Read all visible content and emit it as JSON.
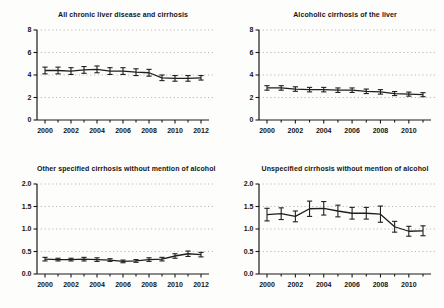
{
  "figure": {
    "background": "#fdfdfb",
    "axis_color": "#1a1a1a",
    "line_color": "#1f1f1f",
    "grid_color": "#a9a9a9",
    "text_color": "#141414"
  },
  "chart_data": [
    {
      "type": "line",
      "title": "All chronic liver disease and cirrhosis",
      "xlabel": "",
      "ylabel": "",
      "x": [
        2000,
        2001,
        2002,
        2003,
        2004,
        2005,
        2006,
        2007,
        2008,
        2009,
        2010,
        2011,
        2012
      ],
      "series": [
        {
          "name": "rate",
          "values": [
            4.4,
            4.4,
            4.35,
            4.45,
            4.5,
            4.35,
            4.35,
            4.25,
            4.2,
            3.75,
            3.7,
            3.7,
            3.75
          ],
          "errors": [
            0.3,
            0.3,
            0.3,
            0.3,
            0.3,
            0.3,
            0.3,
            0.3,
            0.3,
            0.25,
            0.25,
            0.25,
            0.2
          ]
        }
      ],
      "ylim": [
        0,
        8
      ],
      "yticks": [
        0,
        2,
        4,
        6,
        8
      ],
      "ytick_labels": [
        "0",
        "2",
        "4",
        "6",
        "8"
      ],
      "xtick_labels": [
        "2000",
        "2002",
        "2004",
        "2006",
        "2008",
        "2010",
        "2012"
      ],
      "xtick_step": 2,
      "grid": "dotted-horizontal",
      "legend": "none",
      "error_bars": true
    },
    {
      "type": "line",
      "title": "Alcoholic cirrhosis of the liver",
      "xlabel": "",
      "ylabel": "",
      "x": [
        2000,
        2001,
        2002,
        2003,
        2004,
        2005,
        2006,
        2007,
        2008,
        2009,
        2010,
        2011
      ],
      "series": [
        {
          "name": "rate",
          "values": [
            2.85,
            2.85,
            2.75,
            2.7,
            2.7,
            2.65,
            2.65,
            2.55,
            2.5,
            2.35,
            2.3,
            2.25
          ],
          "errors": [
            0.2,
            0.2,
            0.2,
            0.2,
            0.2,
            0.2,
            0.2,
            0.2,
            0.2,
            0.18,
            0.18,
            0.18
          ]
        }
      ],
      "ylim": [
        0,
        8
      ],
      "yticks": [
        0,
        2,
        4,
        6,
        8
      ],
      "ytick_labels": [
        "0",
        "2",
        "4",
        "6",
        "8"
      ],
      "xtick_labels": [
        "2000",
        "2002",
        "2004",
        "2006",
        "2008",
        "2010"
      ],
      "xtick_step": 2,
      "grid": "dotted-horizontal",
      "legend": "none",
      "error_bars": true
    },
    {
      "type": "line",
      "title": "Other specified cirrhosis without mention of alcohol",
      "xlabel": "",
      "ylabel": "",
      "x": [
        2000,
        2001,
        2002,
        2003,
        2004,
        2005,
        2006,
        2007,
        2008,
        2009,
        2010,
        2011,
        2012
      ],
      "series": [
        {
          "name": "rate",
          "values": [
            0.33,
            0.32,
            0.32,
            0.33,
            0.32,
            0.31,
            0.28,
            0.29,
            0.32,
            0.33,
            0.4,
            0.45,
            0.43
          ],
          "errors": [
            0.04,
            0.03,
            0.03,
            0.04,
            0.04,
            0.03,
            0.03,
            0.03,
            0.04,
            0.04,
            0.05,
            0.06,
            0.05
          ]
        }
      ],
      "ylim": [
        0,
        2
      ],
      "yticks": [
        0,
        0.5,
        1,
        1.5,
        2
      ],
      "ytick_labels": [
        "0.0",
        "0.5",
        "1.0",
        "1.5",
        "2.0"
      ],
      "xtick_labels": [
        "2000",
        "2002",
        "2004",
        "2006",
        "2008",
        "2010",
        "2012"
      ],
      "xtick_step": 2,
      "grid": "dotted-horizontal",
      "legend": "none",
      "error_bars": true
    },
    {
      "type": "line",
      "title": "Unspecified cirrhosis without mention of alcohol",
      "xlabel": "",
      "ylabel": "",
      "x": [
        2000,
        2001,
        2002,
        2003,
        2004,
        2005,
        2006,
        2007,
        2008,
        2009,
        2010,
        2011
      ],
      "series": [
        {
          "name": "rate",
          "values": [
            1.32,
            1.34,
            1.28,
            1.45,
            1.46,
            1.4,
            1.35,
            1.35,
            1.33,
            1.05,
            0.95,
            0.96
          ],
          "errors": [
            0.14,
            0.13,
            0.12,
            0.17,
            0.15,
            0.13,
            0.13,
            0.13,
            0.18,
            0.12,
            0.11,
            0.11
          ]
        }
      ],
      "ylim": [
        0,
        2
      ],
      "yticks": [
        0,
        0.5,
        1,
        1.5,
        2
      ],
      "ytick_labels": [
        "0.0",
        "0.5",
        "1.0",
        "1.5",
        "2.0"
      ],
      "xtick_labels": [
        "2000",
        "2002",
        "2004",
        "2006",
        "2008",
        "2010"
      ],
      "xtick_step": 2,
      "grid": "dotted-horizontal",
      "legend": "none",
      "error_bars": true
    }
  ]
}
